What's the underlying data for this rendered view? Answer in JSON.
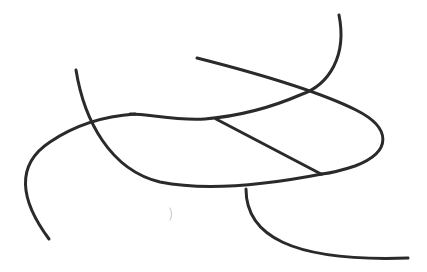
{
  "diagram": {
    "type": "line-drawing",
    "background": "#ffffff",
    "stroke_color": "#2a2a2a",
    "stroke_width": 3,
    "strokes": [
      {
        "id": "top-right-arc",
        "d": "M 339 15 C 348 60 318 100 262 114 C 230 122 205 119 180 116"
      },
      {
        "id": "left-descending-curve",
        "d": "M 76 70 C 88 140 130 185 200 187 C 240 188 290 180 322 172"
      },
      {
        "id": "big-loop",
        "d": "M 49 239 C 15 185 30 140 90 123 C 130 112 160 112 190 116"
      },
      {
        "id": "upper-diagonal",
        "d": "M 197 58 C 270 80 335 95 370 115 C 400 135 385 160 340 170 C 300 180 260 185 220 186"
      },
      {
        "id": "inner-segment",
        "d": "M 216 119 L 321 175"
      },
      {
        "id": "bottom-tail",
        "d": "M 246 191 C 248 240 300 265 408 259"
      },
      {
        "id": "loop-bottom-left",
        "d": "M 30 185 C 60 190 120 190 200 187"
      }
    ],
    "marks": [
      {
        "id": "faint-tick",
        "x": 170,
        "y": 214,
        "color": "#cfcfcf"
      }
    ]
  }
}
